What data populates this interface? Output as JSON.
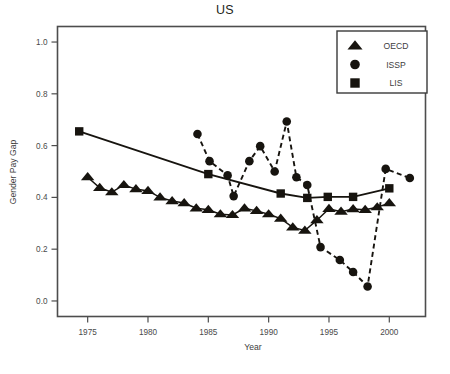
{
  "chart_data": {
    "type": "line",
    "title": "US",
    "xlabel": "Year",
    "ylabel": "Gender Pay Gap",
    "xlim": [
      1972.5,
      2003.0
    ],
    "ylim": [
      -0.06,
      1.06
    ],
    "xticks": [
      1975,
      1980,
      1985,
      1990,
      1995,
      2000
    ],
    "xtick_labels": [
      "1975",
      "1980",
      "1985",
      "1990",
      "1995",
      "2000"
    ],
    "yticks": [
      0.0,
      0.2,
      0.4,
      0.6,
      0.8,
      1.0
    ],
    "ytick_labels": [
      "0.0",
      "0.2",
      "0.4",
      "0.6",
      "0.8",
      "1.0"
    ],
    "grid": false,
    "legend_position": "top-right",
    "series": [
      {
        "name": "OECD",
        "marker": "triangle",
        "linestyle": "solid",
        "color": "#17140f",
        "x": [
          1975,
          1976,
          1977,
          1978,
          1979,
          1980,
          1981,
          1982,
          1983,
          1984,
          1985,
          1986,
          1987,
          1988,
          1989,
          1990,
          1991,
          1992,
          1993,
          1994,
          1995,
          1996,
          1997,
          1998,
          1999,
          2000
        ],
        "y": [
          0.478,
          0.437,
          0.42,
          0.448,
          0.432,
          0.425,
          0.4,
          0.386,
          0.378,
          0.358,
          0.352,
          0.335,
          0.332,
          0.358,
          0.348,
          0.335,
          0.318,
          0.284,
          0.272,
          0.312,
          0.356,
          0.345,
          0.355,
          0.352,
          0.362,
          0.378
        ]
      },
      {
        "name": "ISSP",
        "marker": "circle",
        "linestyle": "dashed",
        "color": "#17140f",
        "x": [
          1984.1,
          1985.1,
          1986.6,
          1987.1,
          1988.4,
          1989.3,
          1990.5,
          1991.5,
          1992.3,
          1993.2,
          1994.3,
          1995.9,
          1997.0,
          1998.2,
          1999.7,
          2001.7
        ],
        "y": [
          0.645,
          0.54,
          0.485,
          0.405,
          0.54,
          0.598,
          0.5,
          0.693,
          0.478,
          0.448,
          0.208,
          0.158,
          0.112,
          0.056,
          0.51,
          0.475
        ]
      },
      {
        "name": "LIS",
        "marker": "square",
        "linestyle": "solid",
        "color": "#17140f",
        "x": [
          1974.3,
          1985.0,
          1991.0,
          1993.2,
          1994.9,
          1997.0,
          2000.0
        ],
        "y": [
          0.655,
          0.49,
          0.415,
          0.398,
          0.402,
          0.402,
          0.435
        ]
      }
    ]
  },
  "legend": {
    "entries": [
      {
        "label": "OECD",
        "marker": "triangle-icon"
      },
      {
        "label": "ISSP",
        "marker": "circle-icon"
      },
      {
        "label": "LIS",
        "marker": "square-icon"
      }
    ]
  }
}
